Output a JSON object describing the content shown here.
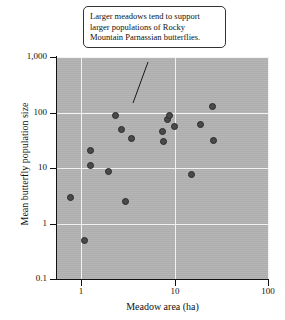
{
  "figure": {
    "background_color": "#ffffff",
    "plot_background_color": "#b3b3b3",
    "grid_color": "#f2f2f2",
    "point_color": "#4a4a4a"
  },
  "annotation": {
    "text": "Larger meadows tend to support larger populations of Rocky Mountain Parnassian butterflies.",
    "leader_from": [
      148,
      62
    ],
    "leader_to": [
      133,
      103
    ]
  },
  "chart_data": {
    "type": "scatter",
    "title": "",
    "xlabel": "Meadow area (ha)",
    "ylabel": "Mean butterfly population size",
    "xscale": "log",
    "yscale": "log",
    "xlim": [
      0.55,
      100
    ],
    "ylim": [
      0.1,
      1000
    ],
    "xticks": [
      1,
      10,
      100
    ],
    "xticklabels": [
      "1",
      "10",
      "100"
    ],
    "yticks": [
      0.1,
      1,
      10,
      100,
      1000
    ],
    "yticklabels": [
      "0.1",
      "1",
      "10",
      "100",
      "1,000"
    ],
    "grid": true,
    "legend": null,
    "series": [
      {
        "name": "Rocky Mountain Parnassian butterflies",
        "marker": "circle",
        "points": [
          {
            "x": 0.76,
            "y": 3.0
          },
          {
            "x": 1.08,
            "y": 0.5
          },
          {
            "x": 1.24,
            "y": 21.0
          },
          {
            "x": 1.24,
            "y": 11.3
          },
          {
            "x": 1.94,
            "y": 8.6
          },
          {
            "x": 2.35,
            "y": 88.0
          },
          {
            "x": 2.68,
            "y": 49.0
          },
          {
            "x": 2.95,
            "y": 2.5
          },
          {
            "x": 3.42,
            "y": 34.0
          },
          {
            "x": 7.4,
            "y": 45.0
          },
          {
            "x": 7.6,
            "y": 29.5
          },
          {
            "x": 8.3,
            "y": 76.0
          },
          {
            "x": 8.7,
            "y": 90.0
          },
          {
            "x": 9.9,
            "y": 56.0
          },
          {
            "x": 15.2,
            "y": 7.8
          },
          {
            "x": 18.9,
            "y": 62.0
          },
          {
            "x": 25.5,
            "y": 128.0
          },
          {
            "x": 26.0,
            "y": 31.0
          }
        ]
      }
    ]
  }
}
